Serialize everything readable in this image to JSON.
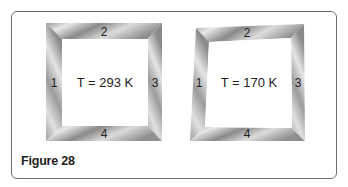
{
  "figure": {
    "caption": "Figure 28"
  },
  "left_frame": {
    "label": "T = 293 K",
    "sides": [
      "1",
      "2",
      "3",
      "4"
    ]
  },
  "right_frame": {
    "label": "T = 170 K",
    "sides": [
      "1",
      "2",
      "3",
      "4"
    ]
  },
  "colors": {
    "border": "#6e6e6e",
    "metal_dark": "#7a7a7a",
    "metal_light": "#e6e6e6",
    "text": "#222222"
  }
}
